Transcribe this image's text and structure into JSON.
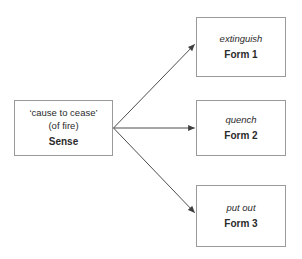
{
  "diagram": {
    "type": "node-link",
    "background_color": "#ffffff",
    "border_color": "#9a9a9a",
    "edge_color": "#4d4d4d",
    "text_color": "#2b2b2b",
    "source_node": {
      "gloss": "‘cause to cease’",
      "qualifier": "(of fire)",
      "label": "Sense"
    },
    "target_nodes": [
      {
        "word": "extinguish",
        "label": "Form 1"
      },
      {
        "word": "quench",
        "label": "Form 2"
      },
      {
        "word": "put out",
        "label": "Form 3"
      }
    ],
    "edges": [
      {
        "from": "Sense",
        "to": "Form 1",
        "style": "solid-arrow"
      },
      {
        "from": "Sense",
        "to": "Form 2",
        "style": "solid-arrow"
      },
      {
        "from": "Sense",
        "to": "Form 3",
        "style": "solid-arrow"
      }
    ]
  }
}
